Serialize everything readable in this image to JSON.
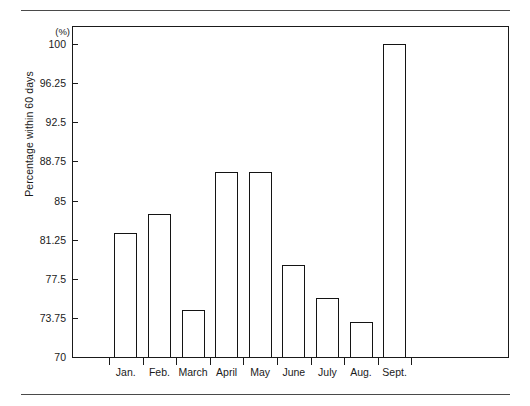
{
  "chart_data": {
    "type": "bar",
    "title": "",
    "subtitle": "",
    "xlabel": "",
    "ylabel": "Percentage within 60 days",
    "unit_label": "(%)",
    "categories": [
      "Jan.",
      "Feb.",
      "March",
      "April",
      "May",
      "June",
      "July",
      "Aug.",
      "Sept."
    ],
    "values": [
      81.9,
      83.7,
      74.5,
      87.7,
      87.7,
      78.8,
      75.7,
      73.4,
      100
    ],
    "ylim": [
      70,
      100
    ],
    "ytick_labels": [
      "70",
      "73.75",
      "77.5",
      "81.25",
      "85",
      "88.75",
      "92.5",
      "96.25",
      "100"
    ],
    "ytick_values": [
      70,
      73.75,
      77.5,
      81.25,
      85,
      88.75,
      92.5,
      96.25,
      100
    ],
    "ytick_step": 3.75,
    "grid": false,
    "legend": null,
    "legend_position": "none",
    "bar_fill_color": "#ffffff",
    "bar_border_color": "#141414",
    "axis_color": "#1a1a1a"
  }
}
